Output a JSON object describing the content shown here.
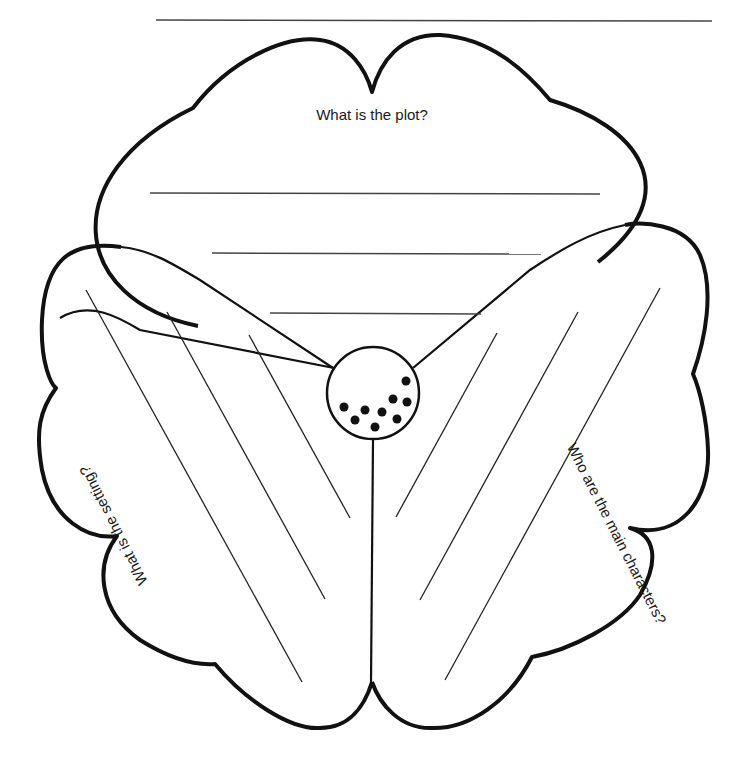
{
  "worksheet": {
    "type": "story-elements-flower-graphic-organizer",
    "name_line": "",
    "petals": [
      {
        "id": "plot",
        "prompt": "What is the plot?",
        "writing_lines": 3
      },
      {
        "id": "setting",
        "prompt": "What is the setting?",
        "writing_lines": 3
      },
      {
        "id": "characters",
        "prompt": "Who are the main characters?",
        "writing_lines": 3
      }
    ],
    "center": {
      "shape": "circle",
      "seed_dots": 9
    },
    "colors": {
      "outline": "#111111",
      "line": "#333333",
      "background": "#ffffff"
    }
  }
}
